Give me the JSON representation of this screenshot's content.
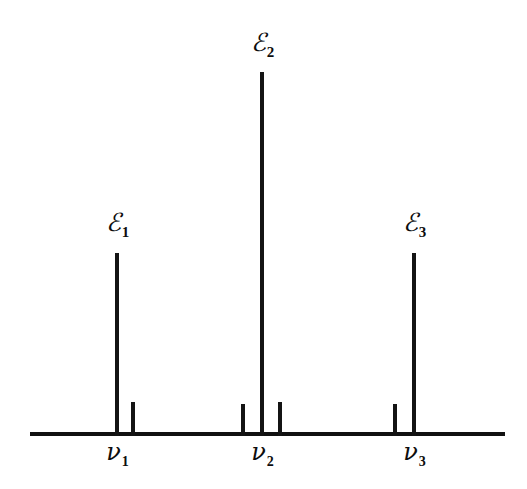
{
  "figure": {
    "background_color": "#ffffff",
    "ink_color": "#111111",
    "axis": {
      "name": "frequency-axis",
      "x_start": 30,
      "x_end": 505,
      "y": 432,
      "thickness": 4
    }
  },
  "chart_data": {
    "type": "bar",
    "title": "",
    "subtitle": "",
    "xlabel": "",
    "ylabel": "",
    "grid": false,
    "legend": null,
    "axis_range_x": [
      30,
      505
    ],
    "axis_range_y": [
      0,
      360
    ],
    "categories": [
      "nu_1 main",
      "nu_1 satellite",
      "nu_2 satellite left",
      "nu_2 main",
      "nu_2 satellite right",
      "nu_3 satellite",
      "nu_3 main"
    ],
    "values": [
      179,
      30,
      28,
      360,
      30,
      28,
      179
    ],
    "x": [
      117,
      133,
      243,
      262,
      280,
      395,
      414
    ],
    "widths": [
      4,
      4,
      4,
      4,
      4,
      4,
      4
    ],
    "tick_labels": [
      "ν₁",
      "ν₂",
      "ν₃"
    ],
    "tick_positions": [
      117,
      262,
      414
    ],
    "annotations": [
      "ℰ₁",
      "ℰ₂",
      "ℰ₃"
    ],
    "annotation_positions": [
      117,
      262,
      414
    ]
  },
  "spikes": [
    {
      "id": "spike-e1-main",
      "x": 117,
      "height": 179,
      "width": 4,
      "group": "nu1",
      "kind": "main"
    },
    {
      "id": "spike-nu1-sat",
      "x": 133,
      "height": 30,
      "width": 4,
      "group": "nu1",
      "kind": "satellite"
    },
    {
      "id": "spike-nu2-sat-left",
      "x": 243,
      "height": 28,
      "width": 4,
      "group": "nu2",
      "kind": "satellite"
    },
    {
      "id": "spike-e2-main",
      "x": 262,
      "height": 360,
      "width": 4,
      "group": "nu2",
      "kind": "main"
    },
    {
      "id": "spike-nu2-sat-right",
      "x": 280,
      "height": 30,
      "width": 4,
      "group": "nu2",
      "kind": "satellite"
    },
    {
      "id": "spike-nu3-sat",
      "x": 395,
      "height": 28,
      "width": 4,
      "group": "nu3",
      "kind": "satellite"
    },
    {
      "id": "spike-e3-main",
      "x": 414,
      "height": 179,
      "width": 4,
      "group": "nu3",
      "kind": "main"
    }
  ],
  "energy_labels": [
    {
      "symbol": "ℰ",
      "subscript": "1",
      "x": 117,
      "y": 210
    },
    {
      "symbol": "ℰ",
      "subscript": "2",
      "x": 262,
      "y": 30
    },
    {
      "symbol": "ℰ",
      "subscript": "3",
      "x": 414,
      "y": 210
    }
  ],
  "frequency_labels": [
    {
      "symbol": "ν",
      "subscript": "1",
      "x": 117,
      "y": 440
    },
    {
      "symbol": "ν",
      "subscript": "2",
      "x": 262,
      "y": 440
    },
    {
      "symbol": "ν",
      "subscript": "3",
      "x": 414,
      "y": 440
    }
  ]
}
